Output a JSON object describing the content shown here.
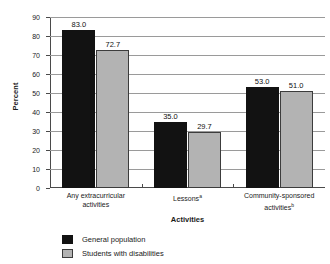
{
  "chart_data": {
    "type": "bar",
    "title": "",
    "xlabel": "Activities",
    "ylabel": "Percent",
    "ylim": [
      0,
      90
    ],
    "ytick_step": 10,
    "yticks": [
      "0",
      "10",
      "20",
      "30",
      "40",
      "50",
      "60",
      "70",
      "80",
      "90"
    ],
    "grid": true,
    "legend_position": "bottom-left",
    "categories": [
      "Any extracurricular activities",
      "Lessons",
      "Community-sponsored activities"
    ],
    "category_lines": [
      [
        "Any extracurricular",
        "activities"
      ],
      [
        "Lessons"
      ],
      [
        "Community-sponsored",
        "activities"
      ]
    ],
    "category_footnotes": [
      "",
      "a",
      "b"
    ],
    "series": [
      {
        "name": "General population",
        "color": "#121212",
        "values": [
          83.0,
          35.0,
          53.0
        ],
        "labels": [
          "83.0",
          "35.0",
          "53.0"
        ]
      },
      {
        "name": "Students with disabilities",
        "color": "#b3b3b3",
        "values": [
          72.7,
          29.7,
          51.0
        ],
        "labels": [
          "72.7",
          "29.7",
          "51.0"
        ]
      }
    ]
  }
}
